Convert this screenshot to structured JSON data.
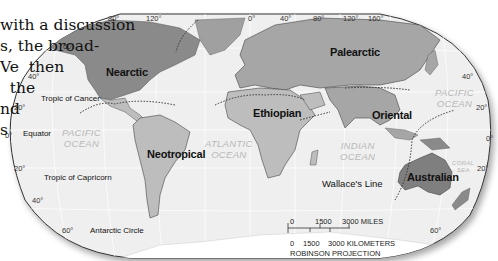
{
  "book_text": {
    "lines": [
      "with a discussion",
      "s, the broad-",
      "Ve  then",
      "  the",
      "nd",
      "s"
    ]
  },
  "map": {
    "projection": "ROBINSON PROJECTION",
    "realms": [
      {
        "name": "Nearctic"
      },
      {
        "name": "Palearctic"
      },
      {
        "name": "Neotropical"
      },
      {
        "name": "Ethiopian"
      },
      {
        "name": "Oriental"
      },
      {
        "name": "Australian"
      }
    ],
    "oceans": [
      {
        "line1": "PACIFIC",
        "line2": "OCEAN"
      },
      {
        "line1": "ATLANTIC",
        "line2": "OCEAN"
      },
      {
        "line1": "INDIAN",
        "line2": "OCEAN"
      },
      {
        "line1": "PACIFIC",
        "line2": "OCEAN"
      },
      {
        "line1": "CORAL",
        "line2": "SEA"
      }
    ],
    "reference_lines": {
      "tropic_cancer": "Tropic of Cancer",
      "equator": "Equator",
      "tropic_capricorn": "Tropic of Capricorn",
      "antarctic_circle": "Antarctic Circle",
      "wallace": "Wallace's Line"
    },
    "longitudes_top": [
      "80°",
      "120°",
      "0°",
      "40°",
      "80°",
      "120°",
      "160°"
    ],
    "latitudes_left": [
      "60°",
      "40°",
      "20°",
      "0°",
      "20°",
      "40°",
      "60°"
    ],
    "latitudes_right": [
      "40°",
      "20°",
      "0°",
      "20°",
      "60°"
    ],
    "scale": {
      "miles": [
        "0",
        "1500",
        "3000 MILES"
      ],
      "km": [
        "0",
        "1500",
        "3000 KILOMETERS"
      ]
    },
    "colors": {
      "ocean": "#efefef",
      "realm_dark": "#8a8a8a",
      "realm_mid": "#a6a6a6",
      "realm_light": "#bdbdbd",
      "border": "#333333"
    }
  }
}
